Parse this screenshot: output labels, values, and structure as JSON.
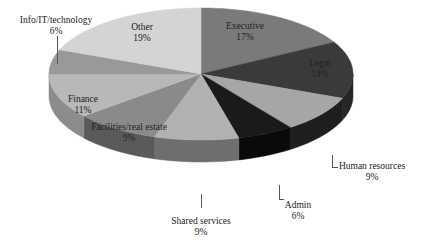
{
  "chart_data": {
    "type": "pie",
    "style": "3d",
    "title": "",
    "start_angle": "12 o'clock",
    "direction": "clockwise",
    "slices": [
      {
        "label": "Executive",
        "value": 17,
        "display": "17%",
        "color": "#7a7a7a",
        "side": "#5e5e5e"
      },
      {
        "label": "Legal",
        "value": 14,
        "display": "14%",
        "color": "#3a3a3a",
        "side": "#262626"
      },
      {
        "label": "Human resources",
        "value": 9,
        "display": "9%",
        "color": "#a6a6a6",
        "side": "#1e1e1e"
      },
      {
        "label": "Admin",
        "value": 6,
        "display": "6%",
        "color": "#1a1a1a",
        "side": "#0a0a0a"
      },
      {
        "label": "Shared services",
        "value": 9,
        "display": "9%",
        "color": "#b2b2b2",
        "side": "#6e6e6e"
      },
      {
        "label": "Facilities/real estate",
        "value": 9,
        "display": "9%",
        "color": "#8a8a8a",
        "side": "#5a5a5a"
      },
      {
        "label": "Finance",
        "value": 11,
        "display": "11%",
        "color": "#b8b8b8",
        "side": "#8c8c8c"
      },
      {
        "label": "Info/IT/technology",
        "value": 6,
        "display": "6%",
        "color": "#999999",
        "side": "#7a7a7a"
      },
      {
        "label": "Other",
        "value": 19,
        "display": "19%",
        "color": "#d4d4d4",
        "side": "#b0b0b0"
      }
    ],
    "legend": "none",
    "data_labels": "category name and percentage"
  },
  "labels": {
    "executive": {
      "name": "Executive",
      "pct": "17%"
    },
    "legal": {
      "name": "Legal",
      "pct": "14%"
    },
    "hr": {
      "name": "Human resources",
      "pct": "9%"
    },
    "admin": {
      "name": "Admin",
      "pct": "6%"
    },
    "shared": {
      "name": "Shared services",
      "pct": "9%"
    },
    "facilities": {
      "name": "Facilities/real estate",
      "pct": "9%"
    },
    "finance": {
      "name": "Finance",
      "pct": "11%"
    },
    "info": {
      "name": "Info/IT/technology",
      "pct": "6%"
    },
    "other": {
      "name": "Other",
      "pct": "19%"
    }
  }
}
